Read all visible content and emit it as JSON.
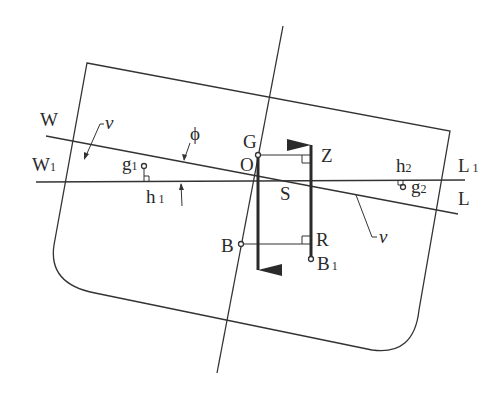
{
  "diagram": {
    "type": "ship-heeled-stability-cross-section",
    "colors": {
      "line": "#333333",
      "background": "#ffffff"
    },
    "labels": {
      "W": "W",
      "W1": {
        "main": "W",
        "sub": "1"
      },
      "L": "L",
      "L1": {
        "main": "L",
        "sub": "1"
      },
      "G": "G",
      "O": "O",
      "Z": "Z",
      "S": "S",
      "R": "R",
      "B": "B",
      "B1": {
        "main": "B",
        "sub": "1"
      },
      "g1": {
        "main": "g",
        "sub": "1"
      },
      "g2": {
        "main": "g",
        "sub": "2"
      },
      "h1": {
        "main": "h",
        "sub": "1"
      },
      "h2": {
        "main": "h",
        "sub": "2"
      },
      "phi": "ϕ",
      "v_left": "v",
      "v_right": "v"
    },
    "elements": [
      "hull-outline",
      "ship-centerline",
      "waterline-WL",
      "waterline-W1L1",
      "gravity-arrow-G",
      "buoyancy-arrow-B1",
      "righting-lever-GZ",
      "lever-BR",
      "wedge-centroid-g1",
      "wedge-centroid-g2",
      "heel-angle-phi"
    ]
  }
}
